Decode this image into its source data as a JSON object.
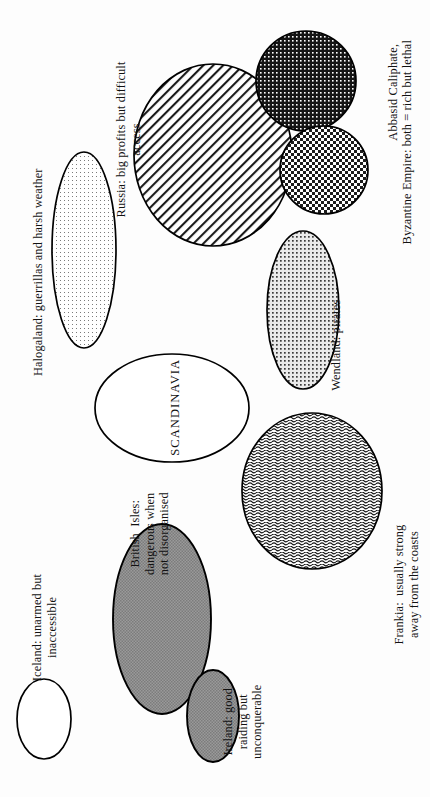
{
  "figure": {
    "background_color": "#fdfdfd",
    "ink_color": "#000000",
    "orientation": "landscape content rotated 90 degrees within a portrait frame"
  },
  "center_label": {
    "text": "SCANDINAVIA",
    "style": "uppercase"
  },
  "regions": [
    {
      "key": "halogaland",
      "label": "Halogaland: guerrillas and harsh weather",
      "shape": "ellipse",
      "fill": "sparse-dots",
      "fill_color": "#ffffff",
      "fill_density": "very-light"
    },
    {
      "key": "russia",
      "label": "Russia: big profits but difficult\naccess",
      "shape": "circle",
      "fill": "diagonal-hatch",
      "fill_color": "#ffffff",
      "fill_density": "medium"
    },
    {
      "key": "abbasid",
      "label": "Abbasid Caliphate,",
      "shape": "circle",
      "fill": "fine-dark-checker",
      "fill_color": "#1a1a1a",
      "fill_density": "very-dark"
    },
    {
      "key": "byzantine",
      "label": "Byzantine Empire: both = rich but lethal",
      "shape": "circle",
      "fill": "coarse-checker",
      "fill_color": "#222222",
      "fill_density": "dark"
    },
    {
      "key": "wendland",
      "label": "Wendland: pirates",
      "shape": "ellipse",
      "fill": "medium-dots",
      "fill_color": "#e8e8e8",
      "fill_density": "light"
    },
    {
      "key": "frankia",
      "label": "Frankia:  usually strong\naway from the coasts",
      "shape": "circle",
      "fill": "wavy-lines",
      "fill_color": "#ffffff",
      "fill_density": "medium"
    },
    {
      "key": "scandinavia",
      "label": "SCANDINAVIA",
      "shape": "ellipse",
      "fill": "none",
      "fill_color": "#ffffff",
      "fill_density": "none"
    },
    {
      "key": "iceland",
      "label": "Iceland: unarmed but\ninaccessible",
      "shape": "ellipse",
      "fill": "none",
      "fill_color": "#ffffff",
      "fill_density": "none"
    },
    {
      "key": "british-isles",
      "label": "British  Isles:\ndangerous when\nnot disorganised",
      "shape": "ellipse",
      "fill": "solid-grey",
      "fill_color": "#8e8e8e",
      "fill_density": "solid"
    },
    {
      "key": "ireland",
      "label": "Ireland: good\nraiding but\nunconquerable",
      "shape": "ellipse",
      "fill": "solid-grey",
      "fill_color": "#8e8e8e",
      "fill_density": "solid"
    }
  ]
}
